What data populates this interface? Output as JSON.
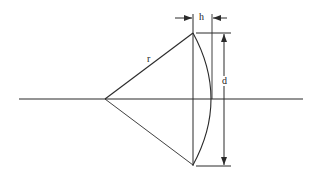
{
  "diagram": {
    "type": "geometry",
    "labels": {
      "radius": "r",
      "height": "h",
      "chord": "d"
    },
    "colors": {
      "line": "#2a2a2a",
      "background": "#ffffff"
    }
  }
}
